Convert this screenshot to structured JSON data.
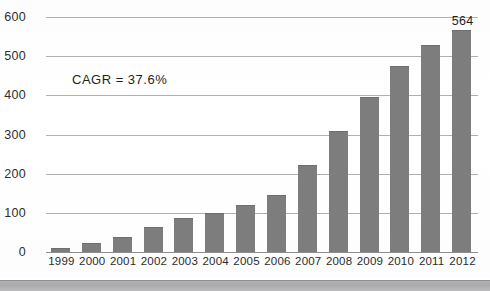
{
  "clipped_title": "— ——— —— —",
  "annotation": {
    "cagr": "CAGR = 37.6%"
  },
  "axis": {
    "y_ticks": [
      "0",
      "100",
      "200",
      "300",
      "400",
      "500",
      "600"
    ]
  },
  "colors": {
    "bar_fill": "#7d7d7d",
    "gridline": "#b0b0b2",
    "text": "#1f1f1f"
  },
  "chart_data": {
    "type": "bar",
    "title": "",
    "xlabel": "",
    "ylabel": "",
    "ylim": [
      0,
      600
    ],
    "grid": true,
    "legend": "none",
    "categories": [
      "1999",
      "2000",
      "2001",
      "2002",
      "2003",
      "2004",
      "2005",
      "2006",
      "2007",
      "2008",
      "2009",
      "2010",
      "2011",
      "2012"
    ],
    "values": [
      8,
      21,
      35,
      62,
      85,
      98,
      118,
      143,
      219,
      307,
      394,
      472,
      525,
      564
    ],
    "data_labels": [
      null,
      null,
      null,
      null,
      null,
      null,
      null,
      null,
      null,
      null,
      null,
      null,
      null,
      "564"
    ],
    "annotations": [
      "CAGR = 37.6%"
    ]
  }
}
